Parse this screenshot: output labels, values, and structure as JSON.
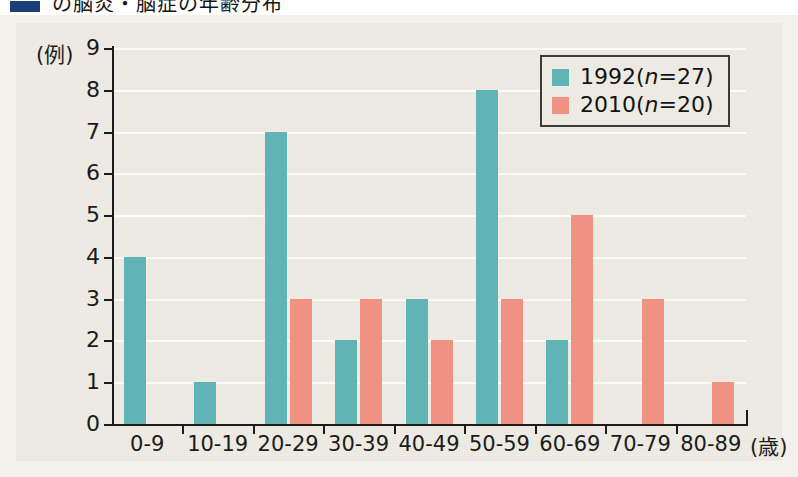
{
  "title_strip": {
    "marker_color": "#1d3f79",
    "text": "の脳炎・脳症の年齢分布"
  },
  "chart_data": {
    "type": "bar",
    "title": "",
    "subtitle": "",
    "xlabel": "(歳)",
    "ylabel": "(例)",
    "categories": [
      "0-9",
      "10-19",
      "20-29",
      "30-39",
      "40-49",
      "50-59",
      "60-69",
      "70-79",
      "80-89"
    ],
    "series": [
      {
        "name": "1992",
        "legend_label": "1992 (n=27)",
        "n": 27,
        "color": "#60b4b5",
        "values": [
          4,
          1,
          7,
          2,
          3,
          8,
          2,
          0,
          0
        ]
      },
      {
        "name": "2010",
        "legend_label": "2010 (n=20)",
        "n": 20,
        "color": "#ef9183",
        "values": [
          0,
          0,
          3,
          3,
          2,
          3,
          5,
          3,
          1
        ]
      }
    ],
    "ylim": [
      0,
      9
    ],
    "yticks": [
      0,
      1,
      2,
      3,
      4,
      5,
      6,
      7,
      8,
      9
    ],
    "ytick_labels": [
      "0",
      "1",
      "2",
      "3",
      "4",
      "5",
      "6",
      "7",
      "8",
      "9"
    ],
    "grid": true,
    "grid_color": "#fbfaf6",
    "legend_position": "top-right",
    "plot_background": "#e9e7df"
  },
  "legend": {
    "rows": [
      {
        "label_year": "1992",
        "label_n": "(n=27)",
        "swatch": "teal"
      },
      {
        "label_year": "2010",
        "label_n": "(n=20)",
        "swatch": "salmon"
      }
    ]
  }
}
